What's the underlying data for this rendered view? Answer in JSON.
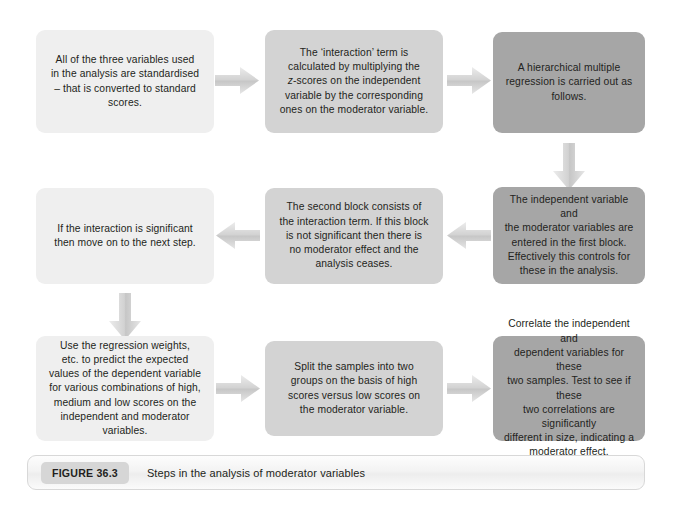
{
  "figure": {
    "label": "FIGURE 36.3",
    "caption": "Steps in the analysis of moderator variables",
    "background": "#ffffff",
    "text_color": "#231f20"
  },
  "palette": {
    "box_light": "#efefef",
    "box_mid": "#d3d3d3",
    "box_dark": "#a6a6a6",
    "arrow_fill": "#cfcfcf",
    "caption_label_bg": "#d6d6d6",
    "caption_border": "#d8d8d8"
  },
  "steps": [
    {
      "id": "step-1",
      "tone": "light",
      "text": "All of the three variables used\nin the analysis are standardised\n– that is converted to standard\nscores."
    },
    {
      "id": "step-2",
      "tone": "mid",
      "text_before_italic": "The ‘interaction’ term is\ncalculated by multiplying the\n",
      "italic": "z",
      "text_after_italic": "-scores on the independent\nvariable by the corresponding\nones on the moderator variable."
    },
    {
      "id": "step-3",
      "tone": "dark",
      "text": "A hierarchical multiple\nregression is carried out as\nfollows."
    },
    {
      "id": "step-4",
      "tone": "dark",
      "text": "The independent variable and\nthe moderator variables are\nentered in the first block.\nEffectively this controls for\nthese in the analysis."
    },
    {
      "id": "step-5",
      "tone": "mid",
      "text": "The second block consists of\nthe interaction term. If this block\nis not significant then there is\nno moderator effect and the\nanalysis ceases."
    },
    {
      "id": "step-6",
      "tone": "light",
      "text": "If the interaction is significant\nthen move on to the next step."
    },
    {
      "id": "step-7",
      "tone": "light",
      "text": "Use the regression weights,\netc. to predict the expected\nvalues of the dependent variable\nfor various combinations of high,\nmedium and low scores on the\nindependent and moderator\nvariables."
    },
    {
      "id": "step-8",
      "tone": "mid",
      "text": "Split the samples into two\ngroups on the basis of high\nscores versus low scores on\nthe moderator variable."
    },
    {
      "id": "step-9",
      "tone": "dark",
      "text": "Correlate the independent and\ndependent variables for these\ntwo samples. Test to see if these\ntwo correlations are significantly\ndifferent in size, indicating a\nmoderator effect."
    }
  ],
  "connectors": [
    {
      "id": "arrow-1",
      "direction": "right",
      "from": "step-1",
      "to": "step-2"
    },
    {
      "id": "arrow-2",
      "direction": "right",
      "from": "step-2",
      "to": "step-3"
    },
    {
      "id": "arrow-3",
      "direction": "down",
      "from": "step-3",
      "to": "step-4"
    },
    {
      "id": "arrow-4",
      "direction": "left",
      "from": "step-4",
      "to": "step-5"
    },
    {
      "id": "arrow-5",
      "direction": "left",
      "from": "step-5",
      "to": "step-6"
    },
    {
      "id": "arrow-6",
      "direction": "down",
      "from": "step-6",
      "to": "step-7"
    },
    {
      "id": "arrow-7",
      "direction": "right",
      "from": "step-7",
      "to": "step-8"
    },
    {
      "id": "arrow-8",
      "direction": "right",
      "from": "step-8",
      "to": "step-9"
    }
  ]
}
